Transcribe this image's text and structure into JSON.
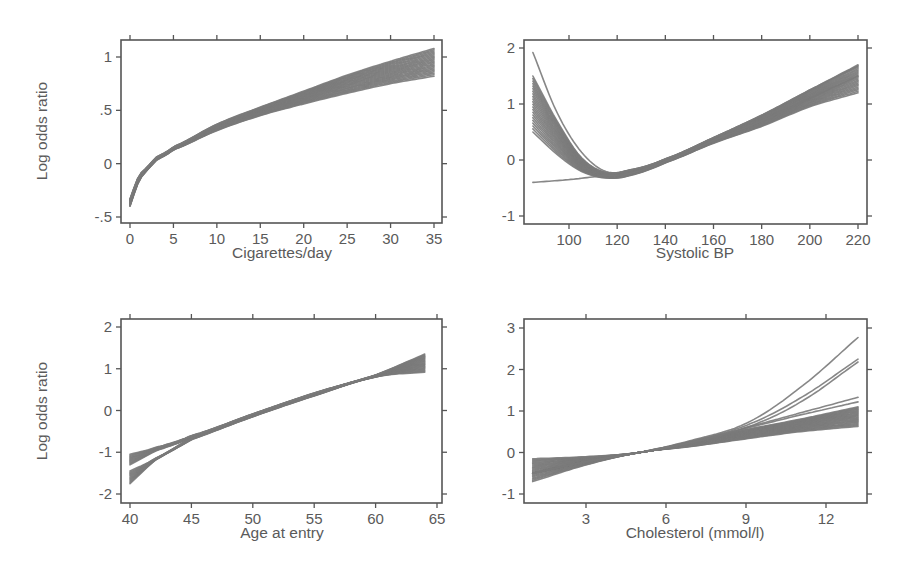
{
  "figure": {
    "width": 911,
    "height": 576,
    "colors": {
      "curve": "#7a7a7a",
      "axis": "#555555",
      "text": "#5a5a5a",
      "background": "#ffffff"
    }
  },
  "chart_data": [
    {
      "type": "line",
      "panel": "top-left",
      "xlabel": "Cigarettes/day",
      "ylabel": "Log odds ratio",
      "xlim": [
        0,
        35
      ],
      "ylim": [
        -0.55,
        1.15
      ],
      "xticks": [
        0,
        5,
        10,
        15,
        20,
        25,
        30,
        35
      ],
      "xtick_labels": [
        "0",
        "5",
        "10",
        "15",
        "20",
        "25",
        "30",
        "35"
      ],
      "yticks": [
        -0.5,
        0,
        0.5,
        1
      ],
      "ytick_labels": [
        "-.5",
        "0",
        ".5",
        "1"
      ],
      "grid": false,
      "description": "Bundle of ~20 bootstrap/imputation curves; concave increasing",
      "series_summary": {
        "x": [
          0,
          1,
          2,
          3,
          5,
          10,
          15,
          20,
          25,
          30,
          35
        ],
        "y_low": [
          -0.4,
          -0.17,
          -0.06,
          0.03,
          0.13,
          0.31,
          0.45,
          0.56,
          0.66,
          0.75,
          0.82
        ],
        "y_high": [
          -0.33,
          -0.12,
          -0.03,
          0.06,
          0.16,
          0.37,
          0.53,
          0.68,
          0.83,
          0.96,
          1.08
        ]
      }
    },
    {
      "type": "line",
      "panel": "top-right",
      "xlabel": "Systolic BP",
      "ylabel": "",
      "xlim": [
        80,
        226
      ],
      "ylim": [
        -1.15,
        2.15
      ],
      "xticks": [
        100,
        120,
        140,
        160,
        180,
        200,
        220
      ],
      "xtick_labels": [
        "100",
        "120",
        "140",
        "160",
        "180",
        "200",
        "220"
      ],
      "yticks": [
        -1,
        0,
        1,
        2
      ],
      "ytick_labels": [
        "-1",
        "0",
        "1",
        "2"
      ],
      "grid": false,
      "description": "U-shaped curves with minimum near 115; one near-linear outlier curve at low BP",
      "series_summary": {
        "x": [
          85,
          95,
          105,
          115,
          125,
          140,
          160,
          180,
          200,
          220
        ],
        "y_low": [
          0.5,
          0.1,
          -0.2,
          -0.32,
          -0.28,
          -0.05,
          0.3,
          0.6,
          0.95,
          1.2
        ],
        "y_high": [
          1.5,
          0.7,
          0.05,
          -0.22,
          -0.18,
          0.02,
          0.4,
          0.8,
          1.25,
          1.7
        ],
        "outlier_upper": {
          "x": [
            85,
            95,
            105,
            115
          ],
          "y": [
            1.92,
            0.85,
            0.15,
            -0.2
          ]
        },
        "outlier_linear": {
          "x": [
            85,
            100,
            115
          ],
          "y": [
            -0.4,
            -0.35,
            -0.28
          ]
        }
      }
    },
    {
      "type": "line",
      "panel": "bottom-left",
      "xlabel": "Age at entry",
      "ylabel": "Log odds ratio",
      "xlim": [
        39.3,
        65.5
      ],
      "ylim": [
        -2.2,
        2.2
      ],
      "xticks": [
        40,
        45,
        50,
        55,
        60,
        65
      ],
      "xtick_labels": [
        "40",
        "45",
        "50",
        "55",
        "60",
        "65"
      ],
      "yticks": [
        -2,
        -1,
        0,
        1,
        2
      ],
      "ytick_labels": [
        "-2",
        "-1",
        "0",
        "1",
        "2"
      ],
      "grid": false,
      "description": "Near-linear increasing curves; two sub-bundles diverge at young ages",
      "series_summary": {
        "x": [
          40,
          42,
          45,
          50,
          55,
          60,
          64
        ],
        "y_low": [
          -1.75,
          -1.2,
          -0.7,
          -0.15,
          0.35,
          0.8,
          0.92
        ],
        "y_high": [
          -1.05,
          -0.85,
          -0.6,
          -0.08,
          0.42,
          0.85,
          1.35
        ]
      }
    },
    {
      "type": "line",
      "panel": "bottom-right",
      "xlabel": "Cholesterol (mmol/l)",
      "ylabel": "",
      "xlim": [
        0.7,
        13.5
      ],
      "ylim": [
        -1.2,
        3.2
      ],
      "xticks": [
        3,
        6,
        9,
        12
      ],
      "xtick_labels": [
        "3",
        "6",
        "9",
        "12"
      ],
      "yticks": [
        -1,
        0,
        1,
        2,
        3
      ],
      "ytick_labels": [
        "-1",
        "0",
        "1",
        "2",
        "3"
      ],
      "grid": false,
      "description": "Curves cross near 5 mmol/l; fan out above 9 with a few convex outliers reaching 2.2-2.8",
      "series_summary": {
        "x": [
          1,
          3,
          5,
          7,
          9,
          11,
          13.2
        ],
        "y_low": [
          -0.7,
          -0.3,
          0.0,
          0.15,
          0.33,
          0.5,
          0.63
        ],
        "y_high": [
          -0.15,
          -0.1,
          0.0,
          0.25,
          0.55,
          0.8,
          1.1
        ],
        "outliers": [
          {
            "x": [
              5,
              7,
              9,
              11,
              13.2
            ],
            "y": [
              0.0,
              0.3,
              0.7,
              1.55,
              2.77
            ]
          },
          {
            "x": [
              5,
              7,
              9,
              11,
              13.2
            ],
            "y": [
              0.0,
              0.28,
              0.65,
              1.3,
              2.25
            ]
          },
          {
            "x": [
              5,
              7,
              9,
              11,
              13.2
            ],
            "y": [
              0.0,
              0.27,
              0.6,
              1.2,
              2.18
            ]
          },
          {
            "x": [
              5,
              7,
              9,
              11,
              13.2
            ],
            "y": [
              0.0,
              0.26,
              0.6,
              0.95,
              1.33
            ]
          },
          {
            "x": [
              5,
              7,
              9,
              11,
              13.2
            ],
            "y": [
              0.0,
              0.25,
              0.58,
              0.9,
              1.22
            ]
          }
        ]
      }
    }
  ],
  "panels_layout": [
    {
      "frame": [
        121,
        40,
        442,
        223
      ],
      "xmap": [
        0,
        130,
        35,
        434
      ],
      "ymap": [
        1,
        57,
        -0.5,
        217
      ]
    },
    {
      "frame": [
        524,
        40,
        867,
        224
      ],
      "xmap": [
        100,
        569,
        220,
        858
      ],
      "ymap": [
        2,
        48,
        -1,
        216
      ]
    },
    {
      "frame": [
        121,
        319,
        442,
        503
      ],
      "xmap": [
        40,
        130,
        65,
        437
      ],
      "ymap": [
        2,
        327,
        -2,
        494
      ]
    },
    {
      "frame": [
        524,
        319,
        867,
        503
      ],
      "xmap": [
        3,
        586,
        12,
        826
      ],
      "ymap": [
        3,
        328,
        -1,
        494
      ]
    }
  ]
}
